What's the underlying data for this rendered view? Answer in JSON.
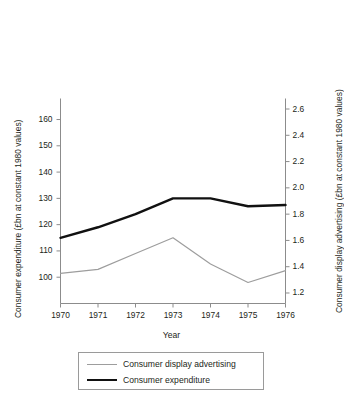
{
  "chart_data": {
    "type": "line",
    "title": "",
    "xlabel": "Year",
    "ylabel": "Consumer expenditure (£bn at constant 1980 values)",
    "y2label": "Consumer display advertising (£bn at constant 1980 values)",
    "categories": [
      "1970",
      "1971",
      "1972",
      "1973",
      "1974",
      "1975",
      "1976"
    ],
    "x": [
      1970,
      1971,
      1972,
      1973,
      1974,
      1975,
      1976
    ],
    "ylim": [
      90,
      168
    ],
    "y2lim": [
      1.12,
      2.68
    ],
    "yticks": [
      100,
      110,
      120,
      130,
      140,
      150,
      160
    ],
    "y2ticks": [
      1.2,
      1.4,
      1.6,
      1.8,
      2.0,
      2.2,
      2.4,
      2.6
    ],
    "ytick_labels": [
      "100",
      "110",
      "120",
      "130",
      "140",
      "150",
      "160"
    ],
    "y2tick_labels": [
      "1.2",
      "1.4",
      "1.6",
      "1.8",
      "2.0",
      "2.2",
      "2.4",
      "2.6"
    ],
    "grid": false,
    "legend_position": "bottom",
    "series": [
      {
        "name": "Consumer display advertising",
        "axis": "right",
        "color": "#9d9d9d",
        "width": 1.2,
        "values": [
          1.35,
          1.38,
          1.5,
          1.62,
          1.42,
          1.28,
          1.37
        ]
      },
      {
        "name": "Consumer expenditure",
        "axis": "left",
        "color": "#111111",
        "width": 2.4,
        "values": [
          115,
          119,
          124,
          130,
          130,
          127,
          127.5
        ]
      }
    ]
  },
  "legend": {
    "items": [
      {
        "label": "Consumer display advertising"
      },
      {
        "label": "Consumer expenditure"
      }
    ]
  }
}
